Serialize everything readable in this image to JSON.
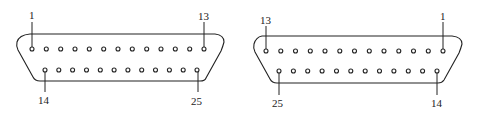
{
  "diagram": {
    "type": "DB-25 connector pinout",
    "connectors": [
      {
        "name": "left",
        "orientation": "male-face",
        "top_row": {
          "first_pin": 1,
          "last_pin": 13,
          "count": 13
        },
        "bottom_row": {
          "first_pin": 14,
          "last_pin": 25,
          "count": 12
        },
        "labels": {
          "top_left": "1",
          "top_right": "13",
          "bottom_left": "14",
          "bottom_right": "25"
        }
      },
      {
        "name": "right",
        "orientation": "female-face",
        "top_row": {
          "first_pin": 13,
          "last_pin": 1,
          "count": 13
        },
        "bottom_row": {
          "first_pin": 25,
          "last_pin": 14,
          "count": 12
        },
        "labels": {
          "top_left": "13",
          "top_right": "1",
          "bottom_left": "25",
          "bottom_right": "14"
        }
      }
    ],
    "colors": {
      "line": "#222222",
      "background": "#ffffff"
    }
  }
}
